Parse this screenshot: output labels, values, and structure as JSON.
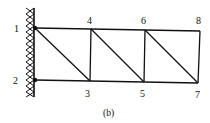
{
  "diagram": {
    "caption": "(b)",
    "type": "truss",
    "support": "fixed-wall-left",
    "nodes": [
      {
        "id": "1",
        "label": "1",
        "x": 35,
        "y": 28
      },
      {
        "id": "2",
        "label": "2",
        "x": 35,
        "y": 80
      },
      {
        "id": "3",
        "label": "3",
        "x": 90,
        "y": 81
      },
      {
        "id": "4",
        "label": "4",
        "x": 91,
        "y": 29
      },
      {
        "id": "5",
        "label": "5",
        "x": 144,
        "y": 82
      },
      {
        "id": "6",
        "label": "6",
        "x": 145,
        "y": 30
      },
      {
        "id": "7",
        "label": "7",
        "x": 198,
        "y": 83
      },
      {
        "id": "8",
        "label": "8",
        "x": 200,
        "y": 31
      }
    ],
    "members": [
      [
        "1",
        "4"
      ],
      [
        "4",
        "6"
      ],
      [
        "6",
        "8"
      ],
      [
        "2",
        "3"
      ],
      [
        "3",
        "5"
      ],
      [
        "5",
        "7"
      ],
      [
        "4",
        "3"
      ],
      [
        "6",
        "5"
      ],
      [
        "8",
        "7"
      ],
      [
        "1",
        "3"
      ],
      [
        "4",
        "5"
      ],
      [
        "6",
        "7"
      ]
    ],
    "colors": {
      "line": "#111111",
      "background": "#ffffff"
    }
  }
}
